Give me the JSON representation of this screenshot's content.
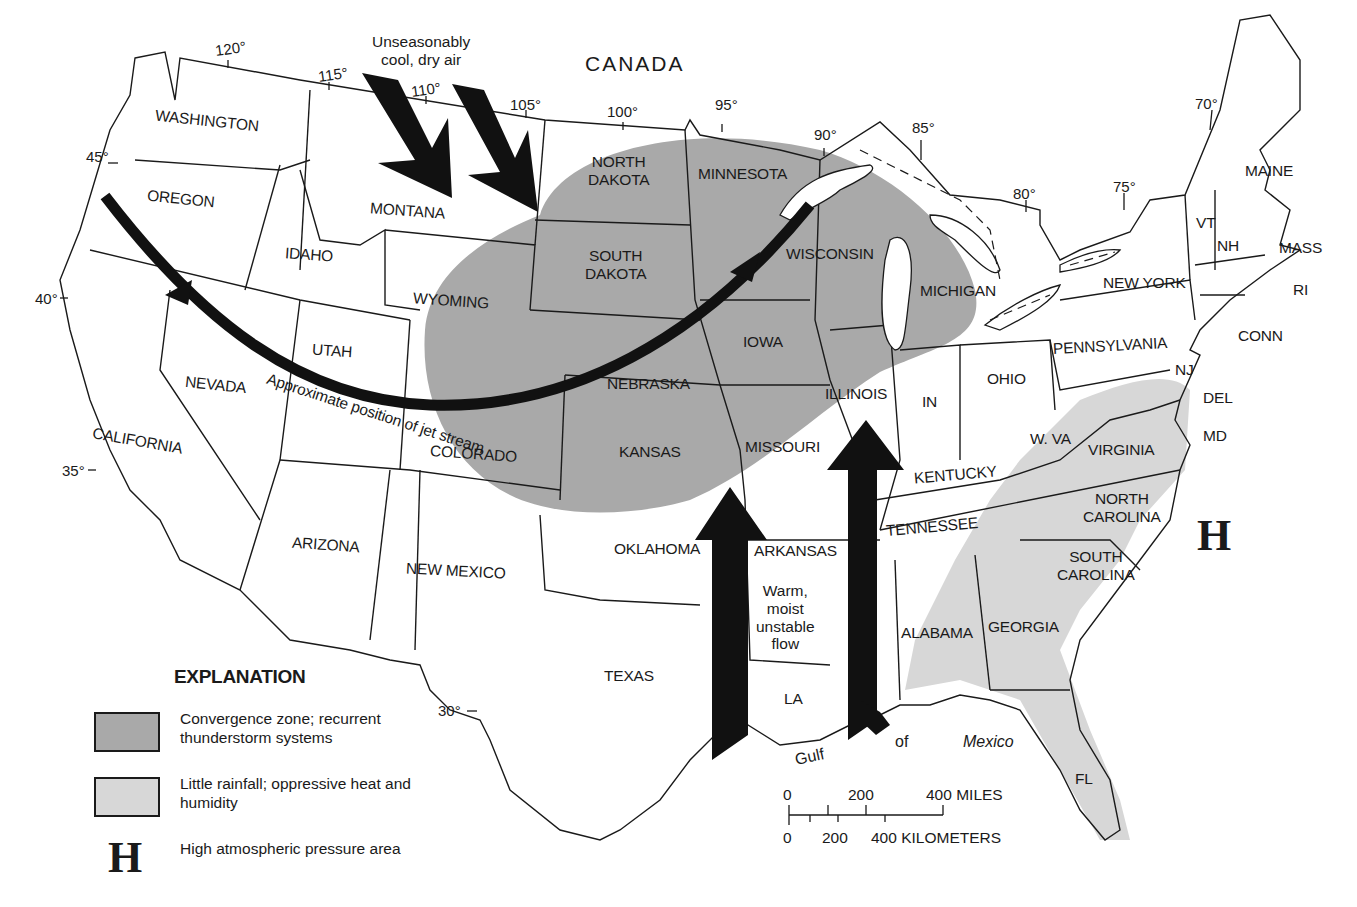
{
  "map": {
    "country_label": "CANADA",
    "notes": {
      "cool_air": "Unseasonably cool, dry air",
      "cool_air_line1": "Unseasonably",
      "cool_air_line2": "cool, dry air",
      "jet_stream": "Approximate position of jet stream",
      "warm_flow_line1": "Warm,",
      "warm_flow_line2": "moist",
      "warm_flow_line3": "unstable",
      "warm_flow_line4": "flow",
      "gulf_word1": "Gulf",
      "gulf_word2": "of",
      "gulf_word3": "Mexico"
    },
    "high_pressure_symbol": "H",
    "longitudes": [
      "120°",
      "115°",
      "110°",
      "105°",
      "100°",
      "95°",
      "90°",
      "85°",
      "80°",
      "75°",
      "70°"
    ],
    "latitudes": [
      "45°",
      "40°",
      "35°",
      "30°"
    ],
    "states": {
      "washington": "WASHINGTON",
      "oregon": "OREGON",
      "idaho": "IDAHO",
      "montana": "MONTANA",
      "wyoming": "WYOMING",
      "california": "CALIFORNIA",
      "nevada": "NEVADA",
      "utah": "UTAH",
      "colorado": "COLORADO",
      "arizona": "ARIZONA",
      "new_mexico": "NEW MEXICO",
      "north_dakota_1": "NORTH",
      "north_dakota_2": "DAKOTA",
      "south_dakota_1": "SOUTH",
      "south_dakota_2": "DAKOTA",
      "nebraska": "NEBRASKA",
      "kansas": "KANSAS",
      "oklahoma": "OKLAHOMA",
      "texas": "TEXAS",
      "minnesota": "MINNESOTA",
      "iowa": "IOWA",
      "missouri": "MISSOURI",
      "arkansas": "ARKANSAS",
      "la": "LA",
      "wisconsin": "WISCONSIN",
      "illinois": "ILLINOIS",
      "michigan": "MICHIGAN",
      "in": "IN",
      "ohio": "OHIO",
      "kentucky": "KENTUCKY",
      "tennessee": "TENNESSEE",
      "alabama": "ALABAMA",
      "georgia": "GEORGIA",
      "fl": "FL",
      "south_carolina_1": "SOUTH",
      "south_carolina_2": "CAROLINA",
      "north_carolina_1": "NORTH",
      "north_carolina_2": "CAROLINA",
      "virginia": "VIRGINIA",
      "w_va": "W. VA",
      "pennsylvania": "PENNSYLVANIA",
      "new_york": "NEW YORK",
      "nj": "NJ",
      "del": "DEL",
      "md": "MD",
      "conn": "CONN",
      "ri": "RI",
      "mass": "MASS",
      "vt": "VT",
      "nh": "NH",
      "maine": "MAINE"
    },
    "colors": {
      "convergence_zone": "#a9a9a9",
      "little_rainfall": "#d7d7d7",
      "ink": "#1a1a1a",
      "background": "#ffffff"
    }
  },
  "legend": {
    "title": "EXPLANATION",
    "items": [
      {
        "swatch": "dark",
        "text": "Convergence zone; recurrent thunderstorm systems"
      },
      {
        "swatch": "light",
        "text": "Little rainfall; oppressive heat and humidity"
      },
      {
        "symbol": "H",
        "text": "High atmospheric pressure area"
      }
    ]
  },
  "scale": {
    "miles_ticks": [
      "0",
      "200",
      "400 MILES"
    ],
    "km_ticks": [
      "0",
      "200",
      "400 KILOMETERS"
    ]
  }
}
